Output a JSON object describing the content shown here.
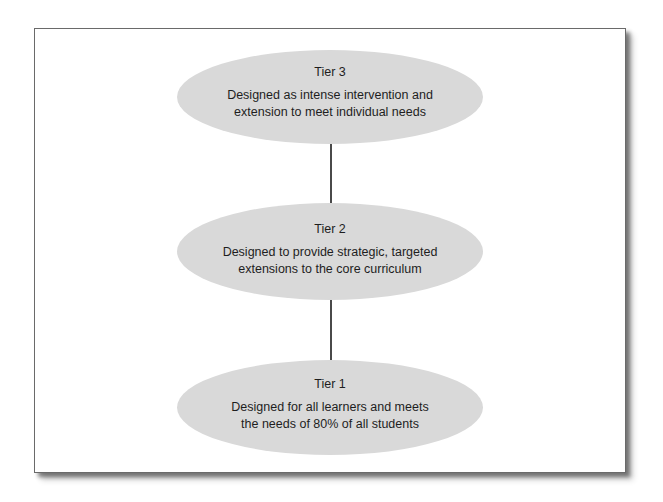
{
  "diagram": {
    "type": "vertical-tier-hierarchy",
    "colors": {
      "node_fill": "#d9d9d9",
      "connector": "#4a4a4a",
      "frame_border": "#6a6a6a",
      "text": "#1e1e1e"
    },
    "tiers": [
      {
        "title": "Tier 3",
        "description_line1": "Designed as intense intervention and",
        "description_line2": "extension to meet individual needs"
      },
      {
        "title": "Tier 2",
        "description_line1": "Designed to provide strategic, targeted",
        "description_line2": "extensions to the core curriculum"
      },
      {
        "title": "Tier 1",
        "description_line1": "Designed for all learners and meets",
        "description_line2": "the needs of 80% of all students"
      }
    ],
    "connections": [
      {
        "from": "Tier 3",
        "to": "Tier 2"
      },
      {
        "from": "Tier 2",
        "to": "Tier 1"
      }
    ]
  }
}
